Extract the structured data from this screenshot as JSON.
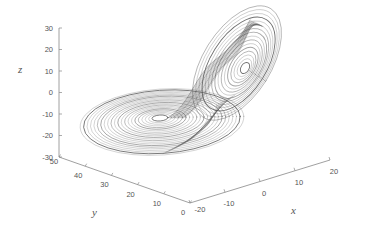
{
  "chart_data": {
    "type": "line",
    "subtype": "3d-parametric",
    "title": "",
    "xlabel": "x",
    "ylabel": "y",
    "zlabel": "z",
    "xlim": [
      -20,
      20
    ],
    "ylim": [
      0,
      50
    ],
    "zlim": [
      -30,
      30
    ],
    "xticks": [
      "-20",
      "-10",
      "0",
      "10",
      "20"
    ],
    "yticks": [
      "0",
      "10",
      "20",
      "30",
      "40",
      "50"
    ],
    "zticks": [
      "30",
      "20",
      "10",
      "0",
      "-10",
      "-20",
      "-30"
    ],
    "grid": false,
    "legend": null,
    "line_color": "#555555",
    "lobes": [
      {
        "name": "left-lobe",
        "center_screen": [
          160,
          118
        ],
        "rings": 22
      },
      {
        "name": "right-lobe",
        "center_screen": [
          245,
          68
        ],
        "rings": 16
      }
    ]
  },
  "axes": {
    "x_label": "x",
    "y_label": "y",
    "z_label": "z"
  }
}
